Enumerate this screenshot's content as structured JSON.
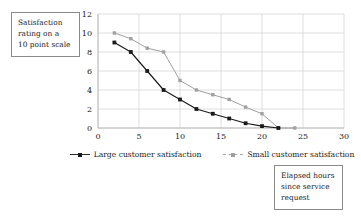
{
  "chart_data": {
    "type": "line",
    "title": "",
    "xlabel": "Elapsed hours since service request",
    "ylabel": "Satisfaction rating on a 10 point scale",
    "xlim": [
      0,
      30
    ],
    "ylim": [
      0,
      12
    ],
    "xticks": [
      0,
      5,
      10,
      15,
      20,
      25,
      30
    ],
    "yticks": [
      0,
      2,
      4,
      6,
      8,
      10,
      12
    ],
    "grid": true,
    "legend_position": "bottom",
    "series": [
      {
        "name": "Large customer satisfaction",
        "color": "#1a1a1a",
        "marker": "square",
        "x": [
          2,
          4,
          6,
          8,
          10,
          12,
          14,
          16,
          18,
          20,
          22
        ],
        "values": [
          9,
          8,
          6,
          4,
          3,
          2,
          1.5,
          1,
          0.5,
          0.2,
          0
        ]
      },
      {
        "name": "Small customer satisfaction",
        "color": "#a0a0a0",
        "marker": "square",
        "x": [
          2,
          4,
          6,
          8,
          10,
          12,
          14,
          16,
          18,
          20,
          22,
          24
        ],
        "values": [
          10,
          9.4,
          8.4,
          8,
          5,
          4,
          3.5,
          3,
          2.2,
          1.5,
          0,
          0
        ]
      }
    ]
  },
  "callouts": {
    "y_axis": {
      "line1": "Satisfaction",
      "line2": "rating on a",
      "line3": "10 point scale"
    },
    "x_axis": {
      "line1": "Elapsed hours",
      "line2": "since service",
      "line3": "request"
    }
  },
  "legend": {
    "entries": [
      {
        "label": "Large customer satisfaction"
      },
      {
        "label": "Small customer satisfaction"
      }
    ]
  },
  "colors": {
    "large_series": "#1a1a1a",
    "small_series": "#a0a0a0",
    "grid": "#d6d6d6",
    "callout_border": "#8a8a8a",
    "text": "#1a1a1a",
    "background": "#ffffff"
  }
}
